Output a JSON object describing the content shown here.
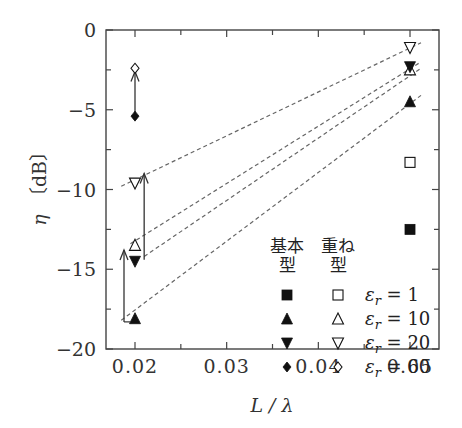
{
  "chart_data": {
    "type": "scatter",
    "title": "",
    "xlabel": "L/λ",
    "ylabel": "η [dB]",
    "xlim": [
      0.017,
      0.0532
    ],
    "ylim": [
      -20,
      0
    ],
    "x_ticks": [
      "0.02",
      "0.03",
      "0.04",
      "0.05"
    ],
    "y_ticks": [
      "0",
      "−5",
      "−10",
      "−15",
      "−20"
    ],
    "grid": false,
    "legend": {
      "position": "lower right inside",
      "column_headers": [
        "基本\n型",
        "重ね\n型"
      ],
      "column_header_lines": [
        [
          "基本",
          "型"
        ],
        [
          "重ね",
          "型"
        ]
      ],
      "entries": [
        {
          "label": "εr = 1",
          "basic_marker": "filled-square",
          "stacked_marker": "open-square"
        },
        {
          "label": "εr = 10",
          "basic_marker": "filled-triangle-up",
          "stacked_marker": "open-triangle-up"
        },
        {
          "label": "εr = 20",
          "basic_marker": "filled-triangle-down",
          "stacked_marker": "open-triangle-down"
        },
        {
          "label": "εr = 60",
          "basic_marker": "filled-diamond",
          "stacked_marker": "open-diamond"
        }
      ]
    },
    "series": [
      {
        "name": "基本型 εr=1",
        "marker": "filled-square",
        "points": [
          [
            0.05,
            -12.5
          ]
        ]
      },
      {
        "name": "重ね型 εr=1",
        "marker": "open-square",
        "points": [
          [
            0.05,
            -8.3
          ]
        ]
      },
      {
        "name": "基本型 εr=10",
        "marker": "filled-triangle-up",
        "points": [
          [
            0.02,
            -18.1
          ],
          [
            0.05,
            -4.5
          ]
        ]
      },
      {
        "name": "重ね型 εr=10",
        "marker": "open-triangle-up",
        "points": [
          [
            0.02,
            -13.5
          ],
          [
            0.05,
            -2.5
          ]
        ]
      },
      {
        "name": "基本型 εr=20",
        "marker": "filled-triangle-down",
        "points": [
          [
            0.02,
            -14.5
          ],
          [
            0.05,
            -2.3
          ]
        ]
      },
      {
        "name": "重ね型 εr=20",
        "marker": "open-triangle-down",
        "points": [
          [
            0.02,
            -9.6
          ],
          [
            0.05,
            -1.1
          ]
        ]
      },
      {
        "name": "基本型 εr=60",
        "marker": "filled-diamond",
        "points": [
          [
            0.02,
            -5.4
          ]
        ]
      },
      {
        "name": "重ね型 εr=60",
        "marker": "open-diamond",
        "points": [
          [
            0.02,
            -2.4
          ]
        ]
      }
    ],
    "dashed_fit_lines": [
      {
        "from": [
          0.0185,
          -18.2
        ],
        "to": [
          0.0512,
          -4.1
        ]
      },
      {
        "from": [
          0.0195,
          -13.4
        ],
        "to": [
          0.0512,
          -2.0
        ]
      },
      {
        "from": [
          0.021,
          -14.2
        ],
        "to": [
          0.0512,
          -2.4
        ]
      },
      {
        "from": [
          0.0185,
          -9.8
        ],
        "to": [
          0.0512,
          -0.8
        ]
      }
    ],
    "arrows": [
      {
        "x": 0.02,
        "from": -5.4,
        "to": -2.6,
        "note": "εr=60 improvement"
      },
      {
        "x": 0.021,
        "from": -14.4,
        "to": -9.0,
        "note": "εr=20 improvement"
      },
      {
        "x": 0.0188,
        "from": -18.3,
        "to": -13.8,
        "note": "εr=10 improvement"
      }
    ]
  },
  "axes": {
    "xlabel": "L / λ",
    "ylabel_symbol": "η",
    "ylabel_unit": "〔dB〕"
  }
}
